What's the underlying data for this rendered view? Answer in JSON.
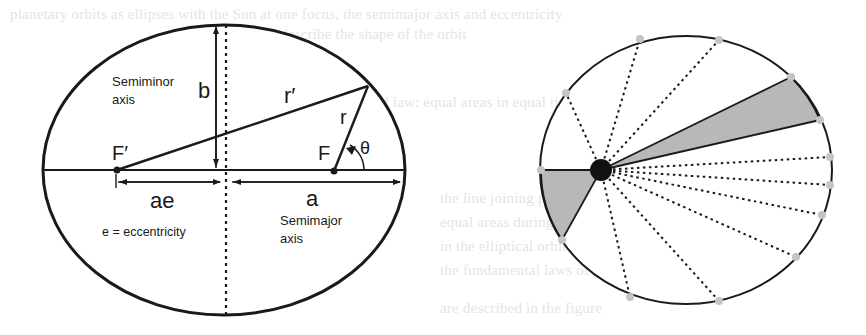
{
  "background_text": [
    "planetary orbits as ellipses with the Sun at one focus, the semimajor axis and eccentricity",
    "describe the shape of the orbit",
    "",
    "Kepler second law: equal areas in equal times",
    "the line joining planet and Sun sweeps out",
    "equal areas during equal intervals of time",
    "in the elliptical orbit of planet around the Sun",
    "the fundamental laws of planetary motion",
    "are described in the figure"
  ],
  "ellipse_diagram": {
    "labels": {
      "semiminor_line1": "Semiminor",
      "semiminor_line2": "axis",
      "b": "b",
      "r_prime": "r′",
      "r": "r",
      "theta": "θ",
      "f_prime": "F′",
      "f": "F",
      "ae": "ae",
      "a": "a",
      "eccentricity": "e = eccentricity",
      "semimajor_line1": "Semimajor",
      "semimajor_line2": "axis"
    },
    "stroke_color": "#1a1a1a"
  },
  "orbit_diagram": {
    "sun_color": "#111111",
    "shade_color": "#b8b8b8",
    "point_color": "#c4c4c4",
    "num_orbit_points": 13,
    "shaded_sectors": 2
  }
}
